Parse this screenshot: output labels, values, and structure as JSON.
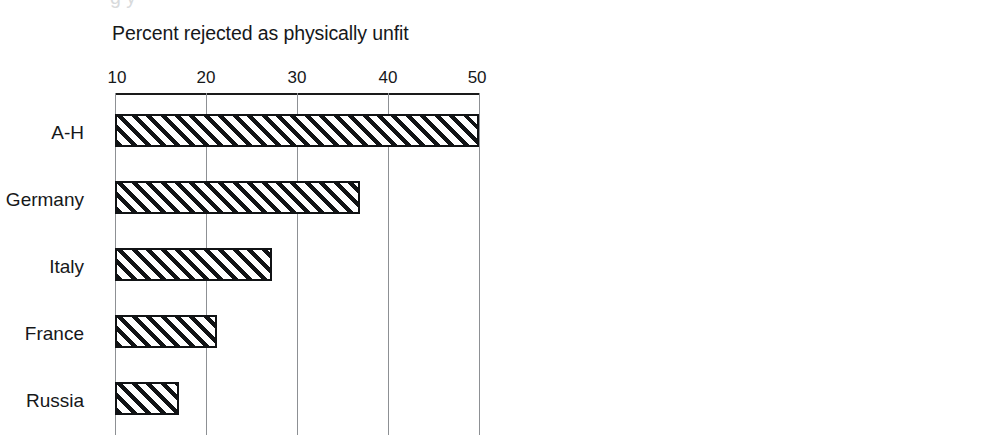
{
  "page": {
    "width": 987,
    "height": 447,
    "background": "#ffffff",
    "ink_color": "#16181a",
    "grid_color": "#8d9094",
    "clipped_top_text": "g  y"
  },
  "charts": {
    "left": {
      "title": "Percent rejected as physically unfit",
      "axis_min": 10,
      "axis_max": 50,
      "ticks": [
        {
          "value": 10,
          "label": "10"
        },
        {
          "value": 20,
          "label": "20"
        },
        {
          "value": 30,
          "label": "30"
        },
        {
          "value": 40,
          "label": "40"
        },
        {
          "value": 50,
          "label": "50"
        }
      ],
      "rows": [
        {
          "label": "A-H",
          "value": 50.0
        },
        {
          "label": "Germany",
          "value": 36.9
        },
        {
          "label": "Italy",
          "value": 27.3
        },
        {
          "label": "France",
          "value": 21.2
        },
        {
          "label": "Russia",
          "value": 17.0
        }
      ]
    },
    "right": {
      "title": "Number of professional NCOs\nper company",
      "axis_min": 0,
      "axis_max": 15,
      "ticks": [
        {
          "value": 0,
          "label": "0"
        },
        {
          "value": 5,
          "label": "5"
        },
        {
          "value": 10,
          "label": "10"
        },
        {
          "value": 15,
          "label": "15"
        }
      ],
      "rows": [
        {
          "label": "Russia",
          "value": 2.2
        },
        {
          "label": "A-H",
          "value": 3.0
        },
        {
          "label": "Italy",
          "value": 3.0
        },
        {
          "label": "France",
          "value": 6.0
        },
        {
          "label": "Germany",
          "value": 11.9
        }
      ]
    }
  },
  "chart_data": [
    {
      "type": "bar",
      "orientation": "horizontal",
      "title": "Percent rejected as physically unfit",
      "xlabel": "",
      "ylabel": "",
      "categories": [
        "A-H",
        "Germany",
        "Italy",
        "France",
        "Russia"
      ],
      "values": [
        50.0,
        36.9,
        27.3,
        21.2,
        17.0
      ],
      "xlim": [
        10,
        50
      ],
      "xticks": [
        10,
        20,
        30,
        40,
        50
      ],
      "grid": "vertical",
      "axis_position": "top",
      "legend": "none",
      "bar_style": "diagonal-hatch-45"
    },
    {
      "type": "bar",
      "orientation": "horizontal",
      "title": "Number of professional NCOs per company",
      "xlabel": "",
      "ylabel": "",
      "categories": [
        "Russia",
        "A-H",
        "Italy",
        "France",
        "Germany"
      ],
      "values": [
        2.2,
        3.0,
        3.0,
        6.0,
        11.9
      ],
      "xlim": [
        0,
        15
      ],
      "xticks": [
        0,
        5,
        10,
        15
      ],
      "grid": "vertical",
      "axis_position": "top",
      "legend": "none",
      "bar_style": "diagonal-hatch-45"
    }
  ]
}
